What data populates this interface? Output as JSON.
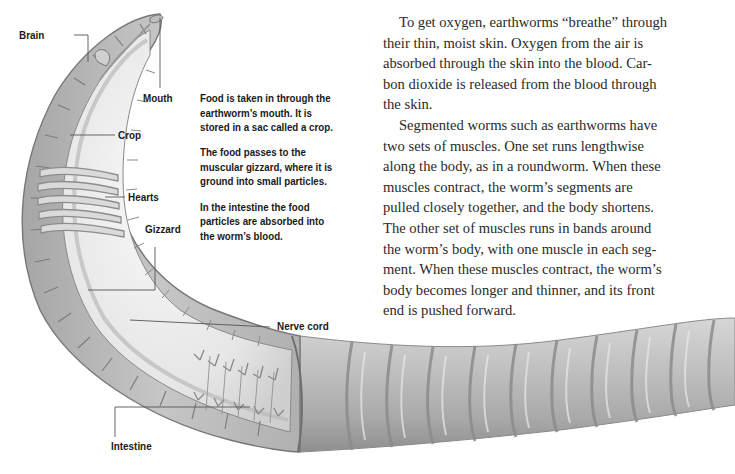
{
  "illustration": {
    "subject": "earthworm-anatomy-cutaway",
    "colors": {
      "body_fill": "#c4c4c4",
      "body_shadow": "#9a9a9a",
      "body_highlight": "#e6e6e6",
      "inner_fill": "#ececec",
      "outline": "#7d7d7d",
      "leader_line": "#555555"
    }
  },
  "labels": {
    "brain": "Brain",
    "mouth": "Mouth",
    "crop": "Crop",
    "hearts": "Hearts",
    "gizzard": "Gizzard",
    "nerve_cord": "Nerve cord",
    "intestine": "Intestine"
  },
  "caption": {
    "paragraphs": [
      [
        "Food is taken in through the",
        "earthworm’s mouth. It is",
        "stored in a sac called a crop."
      ],
      [
        "The food passes to the",
        "muscular gizzard, where it is",
        "ground into small particles."
      ],
      [
        "In the intestine the food",
        "particles are absorbed into",
        "the worm’s blood."
      ]
    ]
  },
  "body_text": {
    "paragraphs": [
      [
        "To get oxygen, earthworms “breathe” through",
        "their thin, moist skin. Oxygen from the air is",
        "absorbed through the skin into the blood. Car-",
        "bon dioxide is released from the blood through",
        "the skin."
      ],
      [
        "Segmented worms such as earthworms have",
        "two sets of muscles. One set runs lengthwise",
        "along the body, as in a roundworm. When these",
        "muscles contract, the worm’s segments are",
        "pulled closely together, and the body shortens.",
        "The other set of muscles runs in bands around",
        "the worm’s body, with one muscle in each seg-",
        "ment. When these muscles contract, the worm’s",
        "body becomes longer and thinner, and its front",
        "end is pushed forward."
      ]
    ]
  }
}
